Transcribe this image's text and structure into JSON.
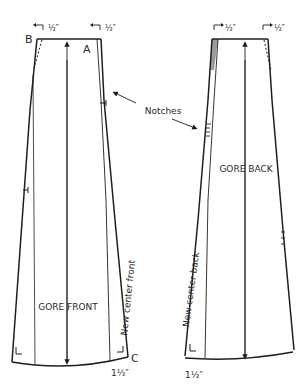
{
  "diagram": {
    "type": "sewing-pattern",
    "colors": {
      "line": "#1e1e1e",
      "fill_wedge": "#9a9a9a",
      "background": "#ffffff"
    },
    "annotation": {
      "label": "Notches"
    },
    "front_piece": {
      "title": "GORE FRONT",
      "side_label": "New center front",
      "point_labels": {
        "b": "B",
        "a": "A",
        "c": "C"
      },
      "top_left_measure": "½″",
      "top_right_measure": "½″",
      "bottom_measure": "1½″"
    },
    "back_piece": {
      "title": "GORE BACK",
      "side_label": "New center back",
      "top_left_measure": "½″",
      "top_right_measure": "½″",
      "bottom_measure": "1½″"
    }
  }
}
